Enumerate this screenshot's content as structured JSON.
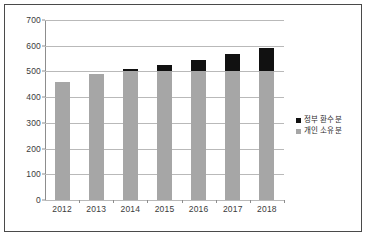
{
  "chart_data": {
    "type": "bar",
    "stacked": true,
    "title": "",
    "subtitle": "",
    "xlabel": "",
    "ylabel": "",
    "categories": [
      "2012",
      "2013",
      "2014",
      "2015",
      "2016",
      "2017",
      "2018"
    ],
    "series": [
      {
        "name": "개인 소유분",
        "color": "#A6A6A6",
        "values": [
          460,
          490,
          500,
          500,
          500,
          500,
          500
        ]
      },
      {
        "name": "정부 환수분",
        "color": "#111111",
        "values": [
          0,
          0,
          10,
          25,
          43,
          67,
          92
        ]
      }
    ],
    "totals": [
      460,
      490,
      510,
      525,
      543,
      567,
      592
    ],
    "ylim": [
      0,
      700
    ],
    "ytick_step": 100,
    "yticks": [
      0,
      100,
      200,
      300,
      400,
      500,
      600,
      700
    ],
    "ytick_labels": [
      "0",
      "100",
      "200",
      "300",
      "400",
      "500",
      "600",
      "700"
    ],
    "grid": true,
    "grid_axis": "y",
    "legend_position": "right",
    "legend_entries": [
      {
        "label": "정부 환수분",
        "color": "#111111"
      },
      {
        "label": "개인 소유분",
        "color": "#A6A6A6"
      }
    ]
  },
  "style": {
    "border_color": "#4A4A4A",
    "background": "#FFFFFF",
    "gridline_color": "#B9B9B9",
    "axis_color": "#8D8D8D",
    "tick_text_color": "#3B3B3B"
  }
}
